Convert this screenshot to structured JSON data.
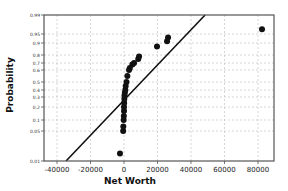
{
  "chart_data": {
    "type": "scatter",
    "title": "",
    "xlabel": "Net Worth",
    "ylabel": "Probability",
    "xlim": [
      -40000,
      90000
    ],
    "ylim": [
      0.01,
      0.99
    ],
    "y_scale": "normal-probability",
    "grid": true,
    "x_ticks": [
      "-40000",
      "-20000",
      "0",
      "20000",
      "40000",
      "60000",
      "80000"
    ],
    "y_ticks": [
      "0.01",
      "0.05",
      "0.1",
      "0.2",
      "0.3",
      "0.4",
      "0.5",
      "0.6",
      "0.7",
      "0.8",
      "0.9",
      "0.95",
      "0.99"
    ],
    "series": [
      {
        "name": "Net Worth",
        "points": [
          {
            "x": -2400,
            "y": 0.02
          },
          {
            "x": -500,
            "y": 0.05
          },
          {
            "x": -400,
            "y": 0.07
          },
          {
            "x": -200,
            "y": 0.1
          },
          {
            "x": -100,
            "y": 0.13
          },
          {
            "x": 0,
            "y": 0.17
          },
          {
            "x": 0,
            "y": 0.2
          },
          {
            "x": 100,
            "y": 0.24
          },
          {
            "x": 200,
            "y": 0.28
          },
          {
            "x": 300,
            "y": 0.32
          },
          {
            "x": 500,
            "y": 0.36
          },
          {
            "x": 800,
            "y": 0.4
          },
          {
            "x": 1000,
            "y": 0.45
          },
          {
            "x": 1500,
            "y": 0.5
          },
          {
            "x": 2000,
            "y": 0.55
          },
          {
            "x": 3000,
            "y": 0.6
          },
          {
            "x": 3500,
            "y": 0.63
          },
          {
            "x": 5000,
            "y": 0.68
          },
          {
            "x": 6000,
            "y": 0.7
          },
          {
            "x": 8500,
            "y": 0.75
          },
          {
            "x": 9000,
            "y": 0.78
          },
          {
            "x": 19700,
            "y": 0.87
          },
          {
            "x": 25700,
            "y": 0.91
          },
          {
            "x": 26300,
            "y": 0.93
          },
          {
            "x": 82400,
            "y": 0.96
          }
        ]
      }
    ],
    "fit_line": {
      "x1": -34600,
      "y1": 0.01,
      "x2": 48400,
      "y2": 0.99
    }
  },
  "axes": {
    "xlabel": "Net Worth",
    "ylabel": "Probability"
  }
}
